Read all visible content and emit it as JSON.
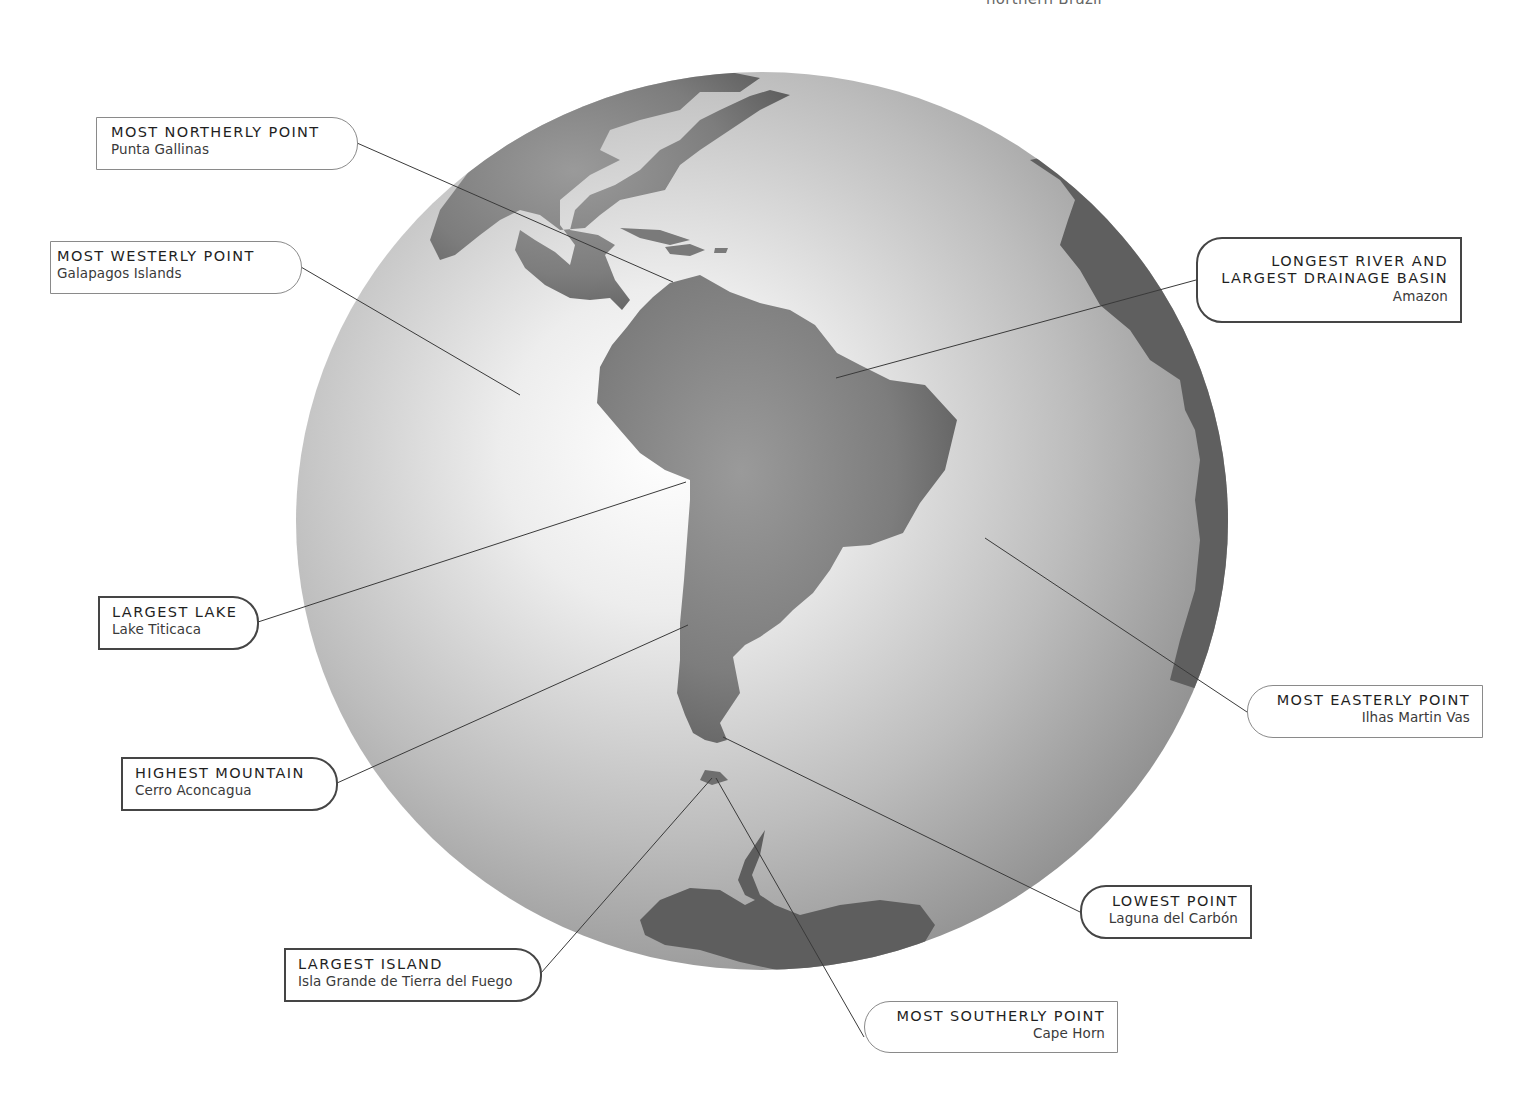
{
  "top_cut_text": "northern Brazil",
  "globe": {
    "center": [
      762,
      521
    ],
    "radius": [
      466,
      449
    ],
    "ocean_highlight": "#fbfbfb",
    "ocean_shadow": "#7a7a7a",
    "land_color": "#7d7d7d",
    "land_dark": "#5e5e5e"
  },
  "callouts": [
    {
      "id": "northerly",
      "title": "MOST NORTHERLY POINT",
      "subtitle": "Punta Gallinas",
      "style": "thin",
      "side": "left"
    },
    {
      "id": "westerly",
      "title": "MOST WESTERLY POINT",
      "subtitle": "Galapagos Islands",
      "style": "thin",
      "side": "left"
    },
    {
      "id": "river",
      "title_line1": "LONGEST RIVER AND",
      "title_line2": "LARGEST DRAINAGE BASIN",
      "subtitle": "Amazon",
      "style": "thick",
      "side": "right"
    },
    {
      "id": "lake",
      "title": "LARGEST LAKE",
      "subtitle": "Lake Titicaca",
      "style": "thick",
      "side": "left"
    },
    {
      "id": "easterly",
      "title": "MOST EASTERLY POINT",
      "subtitle": "Ilhas Martin Vas",
      "style": "thin",
      "side": "right"
    },
    {
      "id": "mountain",
      "title": "HIGHEST MOUNTAIN",
      "subtitle": "Cerro Aconcagua",
      "style": "thick",
      "side": "left"
    },
    {
      "id": "lowest",
      "title": "LOWEST POINT",
      "subtitle": "Laguna del Carbón",
      "style": "thick",
      "side": "right"
    },
    {
      "id": "island",
      "title": "LARGEST ISLAND",
      "subtitle": "Isla Grande de Tierra del Fuego",
      "style": "thick",
      "side": "left"
    },
    {
      "id": "southerly",
      "title": "MOST SOUTHERLY POINT",
      "subtitle": "Cape Horn",
      "style": "thin",
      "side": "right"
    }
  ]
}
